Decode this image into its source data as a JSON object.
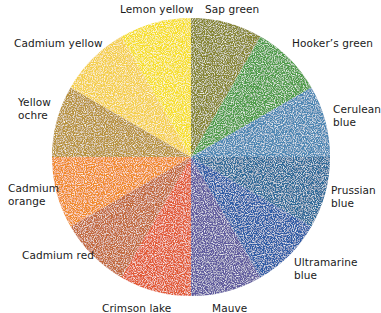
{
  "wheel": {
    "center": [
      191,
      157
    ],
    "radius": 139,
    "segments": [
      {
        "name": "Sap green",
        "lines": [
          "Sap green"
        ],
        "color": "#86852f",
        "start": 0,
        "label_pos": [
          205,
          3
        ]
      },
      {
        "name": "Hooker's green",
        "lines": [
          "Hooker’s green"
        ],
        "color": "#4d9c46",
        "start": 30,
        "label_pos": [
          292,
          37
        ]
      },
      {
        "name": "Cerulean blue",
        "lines": [
          "Cerulean",
          "blue"
        ],
        "color": "#4b86b3",
        "start": 60,
        "label_pos": [
          333,
          103
        ]
      },
      {
        "name": "Prussian blue",
        "lines": [
          "Prussian",
          "blue"
        ],
        "color": "#2f6b99",
        "start": 90,
        "label_pos": [
          331,
          184
        ]
      },
      {
        "name": "Ultramarine blue",
        "lines": [
          "Ultramarine",
          "blue"
        ],
        "color": "#2f5ca6",
        "start": 120,
        "label_pos": [
          294,
          256
        ]
      },
      {
        "name": "Mauve",
        "lines": [
          "Mauve"
        ],
        "color": "#5f5a9e",
        "start": 150,
        "label_pos": [
          212,
          302
        ]
      },
      {
        "name": "Crimson lake",
        "lines": [
          "Crimson lake"
        ],
        "color": "#e25a34",
        "start": 180,
        "label_pos": [
          102,
          302
        ]
      },
      {
        "name": "Cadmium red",
        "lines": [
          "Cadmium red"
        ],
        "color": "#c2673b",
        "start": 210,
        "label_pos": [
          22,
          249
        ]
      },
      {
        "name": "Cadmium orange",
        "lines": [
          "Cadmium",
          "orange"
        ],
        "color": "#f08a2c",
        "start": 240,
        "label_pos": [
          8,
          182
        ]
      },
      {
        "name": "Yellow ochre",
        "lines": [
          "Yellow",
          "ochre"
        ],
        "color": "#b8923b",
        "start": 270,
        "label_pos": [
          18,
          96
        ]
      },
      {
        "name": "Cadmium yellow",
        "lines": [
          "Cadmium yellow"
        ],
        "color": "#f4cf4c",
        "start": 300,
        "label_pos": [
          14,
          37
        ]
      },
      {
        "name": "Lemon yellow",
        "lines": [
          "Lemon yellow"
        ],
        "color": "#f6df2b",
        "start": 330,
        "label_pos": [
          120,
          3
        ]
      }
    ]
  }
}
